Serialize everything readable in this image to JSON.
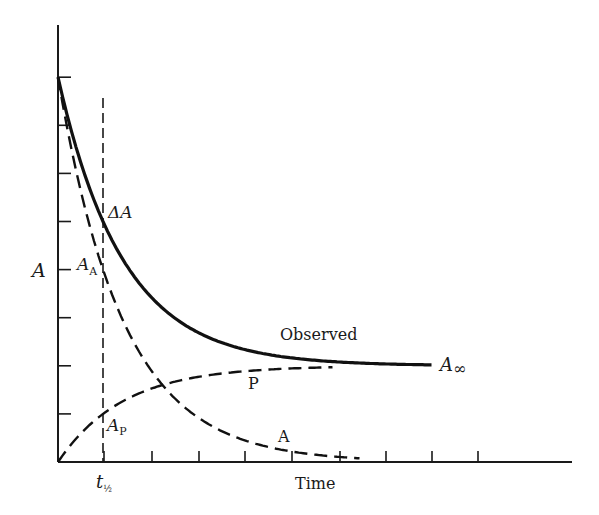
{
  "chart_data": {
    "type": "line",
    "title": "",
    "xlabel": "Time",
    "ylabel": "A",
    "grid": false,
    "legend": "none (curves labeled inline)",
    "x_ticks": 9,
    "y_ticks": 9,
    "x_tick_labels": [
      "t½"
    ],
    "model": {
      "A0": 8,
      "A_inf": 2,
      "half_life": 1,
      "x_units_per_tick": 1,
      "y_units_per_tick": 1
    },
    "series": [
      {
        "name": "Observed",
        "style": "solid thick",
        "x": [
          0,
          0.5,
          1,
          1.5,
          2,
          3,
          4,
          5,
          6,
          7,
          8
        ],
        "values": [
          8,
          6.24,
          5,
          4.12,
          3.5,
          2.75,
          2.38,
          2.19,
          2.09,
          2.05,
          2.02
        ]
      },
      {
        "name": "A",
        "style": "dashed",
        "x": [
          0,
          0.5,
          1,
          1.5,
          2,
          3,
          4,
          5,
          6,
          7
        ],
        "values": [
          6,
          4.24,
          3,
          2.12,
          1.5,
          0.75,
          0.38,
          0.19,
          0.09,
          0.05
        ]
      },
      {
        "name": "P",
        "style": "dashed",
        "x": [
          0,
          0.5,
          1,
          1.5,
          2,
          3,
          4,
          5,
          6
        ],
        "values": [
          0,
          0.59,
          1,
          1.29,
          1.5,
          1.75,
          1.88,
          1.94,
          1.97
        ]
      }
    ],
    "annotations": [
      "ΔA",
      "A_A",
      "A_P",
      "A∞",
      "Observed",
      "P",
      "A",
      "t½"
    ]
  },
  "labels": {
    "y_axis": "A",
    "x_axis": "Time",
    "delta_a": "ΔA",
    "a_a_main": "A",
    "a_a_sub": "A",
    "a_p_main": "A",
    "a_p_sub": "P",
    "a_inf_main": "A",
    "a_inf_sub": "∞",
    "observed": "Observed",
    "p_curve": "P",
    "a_curve": "A",
    "t_half_main": "t",
    "t_half_sub": "½"
  }
}
